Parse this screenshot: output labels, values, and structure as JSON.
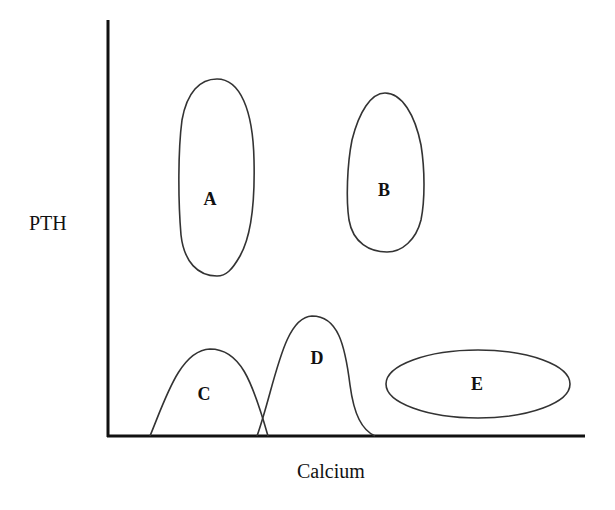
{
  "diagram": {
    "y_axis_label": "PTH",
    "x_axis_label": "Calcium",
    "regions": [
      {
        "id": "A",
        "label": "A",
        "shape": "tall-oval",
        "position": "high PTH, low calcium"
      },
      {
        "id": "B",
        "label": "B",
        "shape": "egg-oval",
        "position": "high PTH, mid-high calcium"
      },
      {
        "id": "C",
        "label": "C",
        "shape": "bell-curve",
        "position": "low PTH, low calcium"
      },
      {
        "id": "D",
        "label": "D",
        "shape": "bell-curve",
        "position": "low PTH, mid calcium"
      },
      {
        "id": "E",
        "label": "E",
        "shape": "horizontal-oval",
        "position": "low PTH, high calcium"
      }
    ]
  }
}
